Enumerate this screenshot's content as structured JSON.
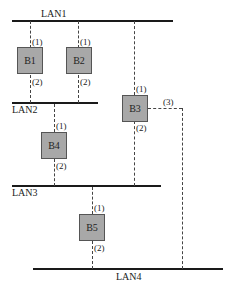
{
  "diagram": {
    "lans": [
      {
        "id": "LAN1",
        "label": "LAN1"
      },
      {
        "id": "LAN2",
        "label": "LAN2"
      },
      {
        "id": "LAN3",
        "label": "LAN3"
      },
      {
        "id": "LAN4",
        "label": "LAN4"
      }
    ],
    "bridges": [
      {
        "id": "B1",
        "label": "B1",
        "ports": {
          "p1": "(1)",
          "p2": "(2)"
        }
      },
      {
        "id": "B2",
        "label": "B2",
        "ports": {
          "p1": "(1)",
          "p2": "(2)"
        }
      },
      {
        "id": "B3",
        "label": "B3",
        "ports": {
          "p1": "(1)",
          "p2": "(2)",
          "p3": "(3)"
        }
      },
      {
        "id": "B4",
        "label": "B4",
        "ports": {
          "p1": "(1)",
          "p2": "(2)"
        }
      },
      {
        "id": "B5",
        "label": "B5",
        "ports": {
          "p1": "(1)",
          "p2": "(2)"
        }
      }
    ],
    "connections": [
      {
        "bridge": "B1",
        "port": "(1)",
        "lan": "LAN1"
      },
      {
        "bridge": "B1",
        "port": "(2)",
        "lan": "LAN2"
      },
      {
        "bridge": "B2",
        "port": "(1)",
        "lan": "LAN1"
      },
      {
        "bridge": "B2",
        "port": "(2)",
        "lan": "LAN2"
      },
      {
        "bridge": "B3",
        "port": "(1)",
        "lan": "LAN1"
      },
      {
        "bridge": "B3",
        "port": "(2)",
        "lan": "LAN3"
      },
      {
        "bridge": "B3",
        "port": "(3)",
        "lan": "LAN4"
      },
      {
        "bridge": "B4",
        "port": "(1)",
        "lan": "LAN2"
      },
      {
        "bridge": "B4",
        "port": "(2)",
        "lan": "LAN3"
      },
      {
        "bridge": "B5",
        "port": "(1)",
        "lan": "LAN3"
      },
      {
        "bridge": "B5",
        "port": "(2)",
        "lan": "LAN4"
      }
    ],
    "colors": {
      "bridge_fill": "#a8a8a8",
      "line": "#1a1a1a",
      "dashed": "#444444"
    }
  }
}
